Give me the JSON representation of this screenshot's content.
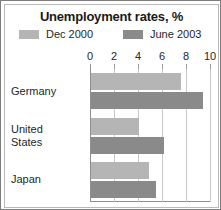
{
  "chart_data": {
    "type": "bar",
    "orientation": "horizontal",
    "title": "Unemployment rates, %",
    "xlabel": "",
    "ylabel": "",
    "categories": [
      "Germany",
      "United States",
      "Japan"
    ],
    "category_lines": [
      [
        "Germany"
      ],
      [
        "United",
        "States"
      ],
      [
        "Japan"
      ]
    ],
    "series": [
      {
        "name": "Dec 2000",
        "color": "#b5b5b5",
        "values": [
          7.5,
          4.0,
          4.8
        ]
      },
      {
        "name": "June 2003",
        "color": "#8a8a8a",
        "values": [
          9.3,
          6.1,
          5.4
        ]
      }
    ],
    "xlim": [
      0,
      10
    ],
    "xticks": [
      0,
      2,
      4,
      6,
      8,
      10
    ],
    "xtick_labels": [
      "0",
      "2",
      "4",
      "6",
      "8",
      "10"
    ],
    "grid": true,
    "legend_position": "top"
  },
  "legend": {
    "entries": [
      {
        "label": "Dec 2000",
        "color": "#b5b5b5"
      },
      {
        "label": "June 2003",
        "color": "#8a8a8a"
      }
    ]
  }
}
